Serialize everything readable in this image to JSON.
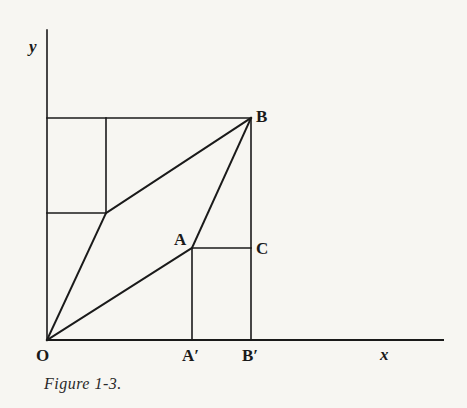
{
  "figure": {
    "caption": "Figure 1-3.",
    "axes": {
      "x_label": "x",
      "y_label": "y",
      "origin_label": "O"
    },
    "points": {
      "O": {
        "label": "O",
        "px": [
          47,
          340
        ]
      },
      "A": {
        "label": "A",
        "px": [
          192,
          248
        ]
      },
      "B": {
        "label": "B",
        "px": [
          251,
          118
        ]
      },
      "C": {
        "label": "C",
        "px": [
          251,
          248
        ]
      },
      "A_prime": {
        "label": "A′",
        "px": [
          192,
          340
        ]
      },
      "B_prime": {
        "label": "B′",
        "px": [
          251,
          340
        ]
      },
      "D": {
        "label": "",
        "px": [
          106,
          213
        ]
      }
    },
    "segments": [
      {
        "from": "O",
        "to": "A",
        "desc": "vector OA"
      },
      {
        "from": "A",
        "to": "B",
        "desc": "vector AB"
      },
      {
        "from": "O",
        "to": "D",
        "desc": "vector OD (parallel to AB)"
      },
      {
        "from": "D",
        "to": "B",
        "desc": "vector DB (parallel to OA)"
      },
      {
        "from": "A",
        "to": "C",
        "desc": "horizontal projection"
      },
      {
        "from": "A",
        "to": "A_prime",
        "desc": "vertical projection"
      },
      {
        "from": "B",
        "to": "B_prime",
        "desc": "vertical projection"
      }
    ],
    "colors": {
      "ink": "#1a1a1a",
      "paper": "#f7f6f2"
    }
  },
  "bleed_text": [
    "",
    "",
    "",
    "",
    ""
  ]
}
